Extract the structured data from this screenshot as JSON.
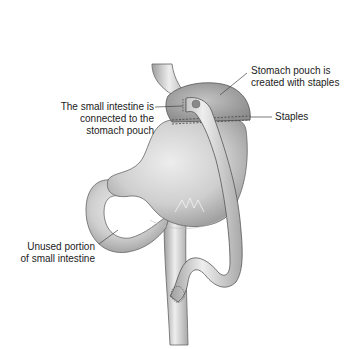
{
  "diagram": {
    "colors": {
      "background": "#ffffff",
      "organ_fill": "#cfcfcf",
      "organ_light": "#ececec",
      "organ_dark": "#9a9a9a",
      "outline": "#555555",
      "text": "#222222",
      "leader": "#444444"
    },
    "labels": {
      "connection": {
        "lines": [
          "The small intestine is",
          "connected to the",
          "stomach pouch"
        ]
      },
      "pouch": {
        "lines": [
          "Stomach pouch is",
          "created with staples"
        ]
      },
      "staples": {
        "lines": [
          "Staples"
        ]
      },
      "unused": {
        "lines": [
          "Unused portion",
          "of small intestine"
        ]
      }
    }
  }
}
